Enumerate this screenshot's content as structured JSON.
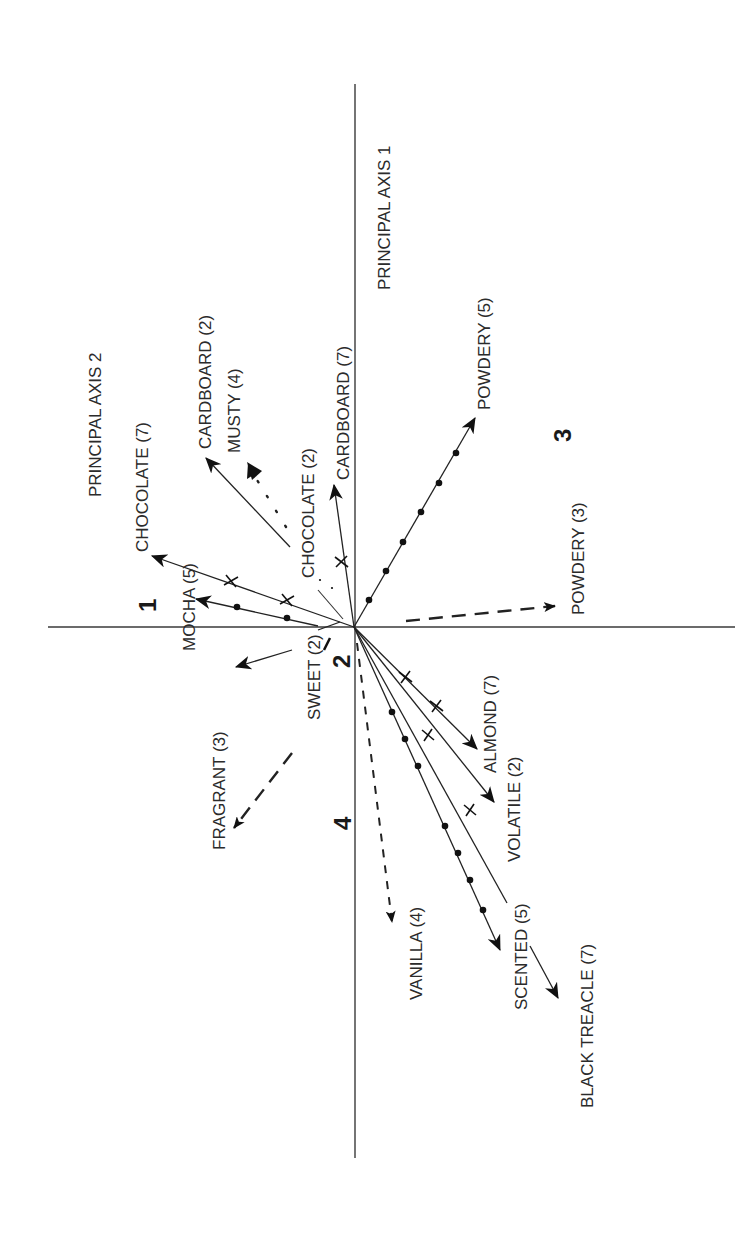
{
  "figure": {
    "type": "biplot",
    "orientation": "rotated 90 degrees counter-clockwise",
    "origin": [
      354,
      627
    ],
    "axes": {
      "axis1_label": "PRINCIPAL AXIS 1",
      "axis2_label": "PRINCIPAL AXIS 2"
    },
    "clusters": [
      {
        "id": "1",
        "label": "1"
      },
      {
        "id": "2",
        "label": "2"
      },
      {
        "id": "3",
        "label": "3"
      },
      {
        "id": "4",
        "label": "4"
      }
    ],
    "vectors": [
      {
        "label": "CHOCOLATE (7)",
        "style": "solid",
        "marker": "cross",
        "end": [
          152,
          556
        ]
      },
      {
        "label": "MOCHA (5)",
        "style": "solid",
        "marker": "dot",
        "end": [
          196,
          599
        ]
      },
      {
        "label": "CARDBOARD (2)",
        "style": "solid",
        "marker": "none",
        "end": [
          206,
          458
        ]
      },
      {
        "label": "MUSTY (4)",
        "style": "dotted",
        "marker": "none",
        "end": [
          248,
          463
        ]
      },
      {
        "label": "CHOCOLATE (2)",
        "style": "dotted",
        "marker": "none",
        "end": [
          304,
          565
        ]
      },
      {
        "label": "CARDBOARD (7)",
        "style": "solid",
        "marker": "cross",
        "end": [
          334,
          485
        ]
      },
      {
        "label": "POWDERY (5)",
        "style": "solid",
        "marker": "dot",
        "end": [
          475,
          418
        ]
      },
      {
        "label": "POWDERY (3)",
        "style": "dash",
        "marker": "none",
        "end": [
          560,
          606
        ]
      },
      {
        "label": "SWEET (2)",
        "style": "solid",
        "marker": "none",
        "end": [
          233,
          668
        ]
      },
      {
        "label": "FRAGRANT (3)",
        "style": "dash",
        "marker": "none",
        "end": [
          230,
          832
        ]
      },
      {
        "label": "VANILLA (4)",
        "style": "shortdash",
        "marker": "none",
        "end": [
          393,
          928
        ]
      },
      {
        "label": "ALMOND (7)",
        "style": "solid",
        "marker": "cross",
        "end": [
          478,
          750
        ]
      },
      {
        "label": "VOLATILE (2)",
        "style": "solid",
        "marker": "none",
        "end": [
          494,
          802
        ]
      },
      {
        "label": "SCENTED (5)",
        "style": "solid",
        "marker": "dot",
        "end": [
          500,
          950
        ]
      },
      {
        "label": "BLACK TREACLE (7)",
        "style": "solid",
        "marker": "cross",
        "end": [
          560,
          1000
        ]
      }
    ]
  },
  "labels": {
    "axis1": "PRINCIPAL AXIS 1",
    "axis2": "PRINCIPAL AXIS 2",
    "chocolate7": "CHOCOLATE (7)",
    "mocha5": "MOCHA (5)",
    "cardboard2": "CARDBOARD (2)",
    "musty4": "MUSTY (4)",
    "chocolate2": "CHOCOLATE (2)",
    "cardboard7": "CARDBOARD (7)",
    "powdery5": "POWDERY (5)",
    "powdery3": "POWDERY (3)",
    "sweet2": "SWEET (2)",
    "fragrant3": "FRAGRANT (3)",
    "vanilla4": "VANILLA (4)",
    "almond7": "ALMOND (7)",
    "volatile2": "VOLATILE (2)",
    "scented5": "SCENTED (5)",
    "blacktreacle7": "BLACK TREACLE (7)",
    "cluster1": "1",
    "cluster2": "2",
    "cluster3": "3",
    "cluster4": "4"
  }
}
